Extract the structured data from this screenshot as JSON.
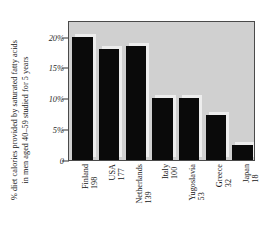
{
  "chart_data": {
    "type": "bar",
    "title": "",
    "subtitle": "",
    "xlabel": "",
    "ylabel": "% diet calories provided by saturated fatty acids in men aged 40–59 studied for 5 years",
    "ylabel_line1": "% diet calories provided by saturated fatty acids",
    "ylabel_line2": "in men aged 40–59 studied for 5 years",
    "categories": [
      "Finland",
      "USA",
      "Netherlands",
      "Italy",
      "Yugoslavia",
      "Greece",
      "Japan"
    ],
    "category_values": [
      "198",
      "177",
      "139",
      "100",
      "53",
      "32",
      "18"
    ],
    "values": [
      20.0,
      18.0,
      18.5,
      10.0,
      10.0,
      7.3,
      2.5
    ],
    "ylim": [
      0,
      22.7
    ],
    "yticks": [
      0,
      5,
      10,
      15,
      20
    ],
    "ytick_labels": [
      "0",
      "5%",
      "10%",
      "15%",
      "20%"
    ],
    "grid": false,
    "legend": null,
    "legend_position": "none",
    "bar_color": "#0a0a0a",
    "plot_background": "#d0d0d0",
    "figure_background": "#ffffff",
    "axis_color": "#333333"
  }
}
